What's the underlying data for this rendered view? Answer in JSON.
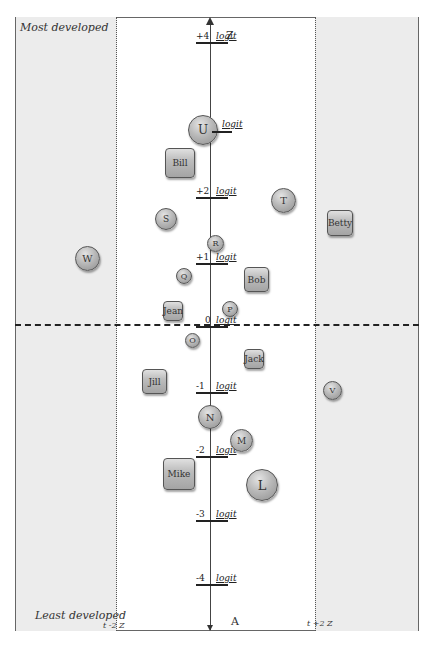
{
  "labels": {
    "top_left": "Most developed",
    "bottom_left": "Least developed",
    "axis_top": "Z",
    "axis_bottom": "A",
    "left_boundary": "t -2  Z",
    "right_boundary": "t +2  Z",
    "unit": "logit"
  },
  "ticks": [
    {
      "value": "+4",
      "y": 38
    },
    {
      "value": "+2",
      "y": 193
    },
    {
      "value": "+1",
      "y": 259
    },
    {
      "value": "0",
      "y": 322
    },
    {
      "value": "-1",
      "y": 388
    },
    {
      "value": "-2",
      "y": 452
    },
    {
      "value": "-3",
      "y": 516
    },
    {
      "value": "-4",
      "y": 580
    }
  ],
  "persons": [
    {
      "label": "Bill",
      "shape": "square",
      "x": 165,
      "y": 148,
      "w": 30,
      "h": 30
    },
    {
      "label": "Betty",
      "shape": "square",
      "x": 327,
      "y": 210,
      "w": 26,
      "h": 26
    },
    {
      "label": "Bob",
      "shape": "square",
      "x": 244,
      "y": 267,
      "w": 25,
      "h": 25
    },
    {
      "label": "Jean",
      "shape": "square",
      "x": 163,
      "y": 301,
      "w": 20,
      "h": 20
    },
    {
      "label": "Jack",
      "shape": "square",
      "x": 244,
      "y": 349,
      "w": 20,
      "h": 20
    },
    {
      "label": "Jill",
      "shape": "square",
      "x": 142,
      "y": 369,
      "w": 25,
      "h": 25
    },
    {
      "label": "Mike",
      "shape": "square",
      "x": 163,
      "y": 458,
      "w": 32,
      "h": 32
    }
  ],
  "items": [
    {
      "label": "U",
      "shape": "circle",
      "x": 188,
      "y": 115,
      "d": 30
    },
    {
      "label": "T",
      "shape": "circle",
      "x": 271,
      "y": 188,
      "d": 25
    },
    {
      "label": "S",
      "shape": "circle",
      "x": 155,
      "y": 208,
      "d": 22
    },
    {
      "label": "R",
      "shape": "circle",
      "x": 207,
      "y": 235,
      "d": 17
    },
    {
      "label": "W",
      "shape": "circle",
      "x": 75,
      "y": 246,
      "d": 25
    },
    {
      "label": "Q",
      "shape": "circle",
      "x": 176,
      "y": 268,
      "d": 16
    },
    {
      "label": "P",
      "shape": "circle",
      "x": 222,
      "y": 301,
      "d": 16
    },
    {
      "label": "O",
      "shape": "circle",
      "x": 185,
      "y": 333,
      "d": 15
    },
    {
      "label": "V",
      "shape": "circle",
      "x": 323,
      "y": 381,
      "d": 19
    },
    {
      "label": "N",
      "shape": "circle",
      "x": 198,
      "y": 405,
      "d": 24
    },
    {
      "label": "M",
      "shape": "circle",
      "x": 230,
      "y": 429,
      "d": 23
    },
    {
      "label": "L",
      "shape": "circle",
      "x": 246,
      "y": 469,
      "d": 32
    }
  ],
  "colors": {
    "panel": "#ececec",
    "frame": "#666666",
    "node_fill": "#b9b9b9"
  }
}
